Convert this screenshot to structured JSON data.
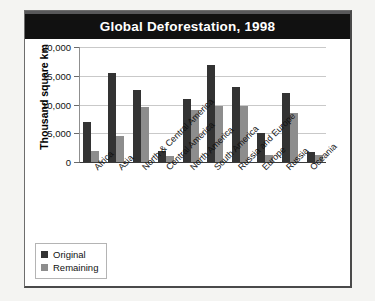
{
  "card": {
    "title": "Global Deforestation, 1998"
  },
  "legend": {
    "original_label": "Original",
    "remaining_label": "Remaining"
  },
  "chart_data": {
    "type": "bar",
    "title": "Global Deforestation, 1998",
    "xlabel": "",
    "ylabel": "Thousand square km",
    "ylim": [
      0,
      20000
    ],
    "yticks": [
      0,
      5000,
      10000,
      15000,
      20000
    ],
    "ytick_labels": [
      "0",
      "5,000",
      "10,000",
      "15,000",
      "20,000"
    ],
    "grid": true,
    "legend_position": "bottom-left",
    "categories": [
      "Africa",
      "Asia",
      "North & Central America",
      "Central America",
      "North America",
      "South America",
      "Russia and Europe",
      "Europe",
      "Russia",
      "Oceania"
    ],
    "series": [
      {
        "name": "Original",
        "color": "#333333",
        "values": [
          7000,
          15500,
          12500,
          2000,
          11000,
          16800,
          13000,
          5000,
          12000,
          1700
        ]
      },
      {
        "name": "Remaining",
        "color": "#8d8d8d",
        "values": [
          2000,
          4500,
          9500,
          1000,
          9000,
          9800,
          9800,
          1200,
          8500,
          1300
        ]
      }
    ]
  }
}
